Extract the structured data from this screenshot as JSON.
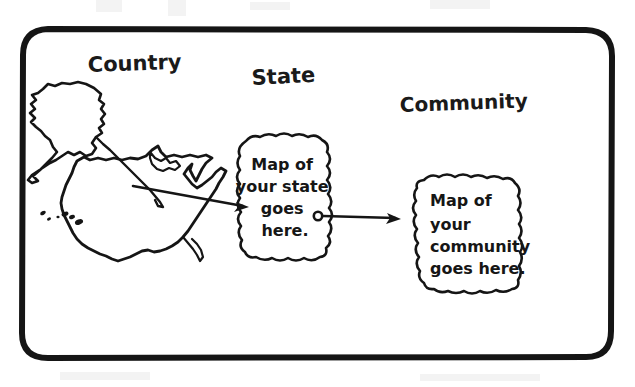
{
  "diagram": {
    "title_headings": [
      {
        "id": "country",
        "label": "Country",
        "x": 88,
        "y": 72,
        "rotate": -2,
        "size": 21
      },
      {
        "id": "state",
        "label": "State",
        "x": 252,
        "y": 85,
        "rotate": -3,
        "size": 21
      },
      {
        "id": "community",
        "label": "Community",
        "x": 400,
        "y": 112,
        "rotate": -2,
        "size": 20
      }
    ],
    "state_blob": {
      "name": "state-map-placeholder",
      "lines": [
        "Map of",
        "your state",
        "goes",
        "here."
      ],
      "text_x": 285,
      "text_y": 170,
      "line_height": 20,
      "font_size": 14
    },
    "community_blob": {
      "name": "community-map-placeholder",
      "lines": [
        "Map of",
        "your",
        "community",
        "goes here."
      ],
      "text_x": 428,
      "text_y": 206,
      "line_height": 21,
      "font_size": 13
    },
    "arrows": [
      {
        "id": "country-to-state",
        "from_x": 133,
        "from_y": 186,
        "to_x": 248,
        "to_y": 207,
        "has_start_dot": false
      },
      {
        "id": "state-to-community",
        "from_x": 318,
        "from_y": 216,
        "to_x": 400,
        "to_y": 219,
        "has_start_dot": true
      }
    ],
    "country_map": {
      "name": "united-states-map",
      "parts": [
        "contiguous-usa",
        "alaska",
        "hawaii-islands"
      ]
    },
    "frame": {
      "name": "diagram-border",
      "x": 22,
      "y": 29,
      "width": 590,
      "height": 329,
      "radius": 26,
      "stroke_width": 6
    },
    "colors": {
      "ink": "#151515",
      "background": "#ffffff",
      "smudge": "#f3f3f3"
    }
  }
}
